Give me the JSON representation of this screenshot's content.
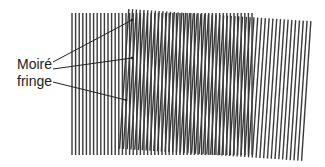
{
  "figure": {
    "labels": {
      "line1": "Moiré",
      "line2": "fringe"
    },
    "colors": {
      "background": "#ffffff",
      "line": "#3a3a3a",
      "text": "#222222",
      "leader": "#222222"
    },
    "grating_a": {
      "description": "straight vertical line grating",
      "x0": 72,
      "x1": 255,
      "y0": 13,
      "y1": 155,
      "pitch": 3.6,
      "line_width": 1.4,
      "rotation_deg": 0
    },
    "grating_b": {
      "description": "slightly rotated vertical line grating",
      "cx": 216,
      "cy": 85,
      "width": 184,
      "height": 140,
      "pitch": 3.8,
      "line_width": 1.4,
      "rotation_deg": 3.8
    },
    "leaders": [
      {
        "from": [
          53,
          62
        ],
        "to": [
          132,
          20
        ]
      },
      {
        "from": [
          53,
          69
        ],
        "to": [
          132,
          58
        ]
      },
      {
        "from": [
          53,
          82
        ],
        "to": [
          126,
          100
        ]
      }
    ]
  }
}
